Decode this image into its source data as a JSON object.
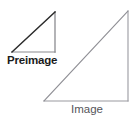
{
  "figure": {
    "canvas": {
      "width": 140,
      "height": 121,
      "background": "#ffffff"
    },
    "shapes": [
      {
        "name": "preimage-triangle",
        "kind": "right-triangle",
        "label": "Preimage",
        "vertices": [
          [
            12,
            52
          ],
          [
            55,
            52
          ],
          [
            55,
            12
          ]
        ],
        "leg_horizontal": 43,
        "leg_vertical": 40,
        "hypotenuse_color": "#2b2b2b",
        "leg_color": "#8b8b90",
        "stroke_width": 1.2
      },
      {
        "name": "image-triangle",
        "kind": "right-triangle",
        "label": "Image",
        "vertices": [
          [
            44,
            101
          ],
          [
            128,
            101
          ],
          [
            128,
            11
          ]
        ],
        "leg_horizontal": 84,
        "leg_vertical": 90,
        "hypotenuse_color": "#8f8f95",
        "leg_color": "#9a9aa0",
        "stroke_width": 1.1
      }
    ],
    "labels": {
      "preimage": "Preimage",
      "image": "Image"
    },
    "colors": {
      "background": "#ffffff",
      "preimage_text": "#1b1b1b",
      "image_text": "#55555a",
      "dark_stroke": "#2b2b2b",
      "light_stroke": "#8f8f95"
    }
  }
}
